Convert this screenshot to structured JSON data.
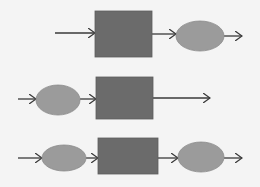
{
  "diagram": {
    "title": "",
    "background": "#f4f4f4",
    "colors": {
      "process": "#6b6b6b",
      "state": "#9b9b9b",
      "arrow": "#3a3a3a",
      "stroke": "#8a8a8a"
    },
    "rows": [
      {
        "name": "row-1",
        "sequence": [
          "arrow",
          "process-box",
          "arrow",
          "ellipse",
          "arrow"
        ],
        "boxes": [
          {
            "x": 95,
            "y": 11,
            "w": 57,
            "h": 46
          }
        ],
        "ellipses": [
          {
            "cx": 200,
            "cy": 36,
            "rx": 24,
            "ry": 15
          }
        ],
        "arrows": [
          {
            "x1": 55,
            "y1": 33,
            "x2": 95,
            "y2": 33
          },
          {
            "x1": 152,
            "y1": 34,
            "x2": 176,
            "y2": 34
          },
          {
            "x1": 224,
            "y1": 36,
            "x2": 242,
            "y2": 36
          }
        ]
      },
      {
        "name": "row-2",
        "sequence": [
          "arrow",
          "ellipse",
          "arrow",
          "process-box",
          "arrow"
        ],
        "boxes": [
          {
            "x": 96,
            "y": 77,
            "w": 57,
            "h": 42
          }
        ],
        "ellipses": [
          {
            "cx": 58,
            "cy": 100,
            "rx": 22,
            "ry": 15
          }
        ],
        "arrows": [
          {
            "x1": 18,
            "y1": 99,
            "x2": 36,
            "y2": 99
          },
          {
            "x1": 80,
            "y1": 99,
            "x2": 96,
            "y2": 99
          },
          {
            "x1": 153,
            "y1": 98,
            "x2": 210,
            "y2": 98
          }
        ]
      },
      {
        "name": "row-3",
        "sequence": [
          "arrow",
          "ellipse",
          "arrow",
          "process-box",
          "arrow",
          "ellipse",
          "arrow"
        ],
        "boxes": [
          {
            "x": 98,
            "y": 138,
            "w": 60,
            "h": 36
          }
        ],
        "ellipses": [
          {
            "cx": 64,
            "cy": 158,
            "rx": 22,
            "ry": 13
          },
          {
            "cx": 201,
            "cy": 157,
            "rx": 23,
            "ry": 15
          }
        ],
        "arrows": [
          {
            "x1": 18,
            "y1": 158,
            "x2": 42,
            "y2": 158
          },
          {
            "x1": 86,
            "y1": 158,
            "x2": 98,
            "y2": 158
          },
          {
            "x1": 158,
            "y1": 158,
            "x2": 178,
            "y2": 158
          },
          {
            "x1": 224,
            "y1": 158,
            "x2": 242,
            "y2": 158
          }
        ]
      }
    ]
  }
}
